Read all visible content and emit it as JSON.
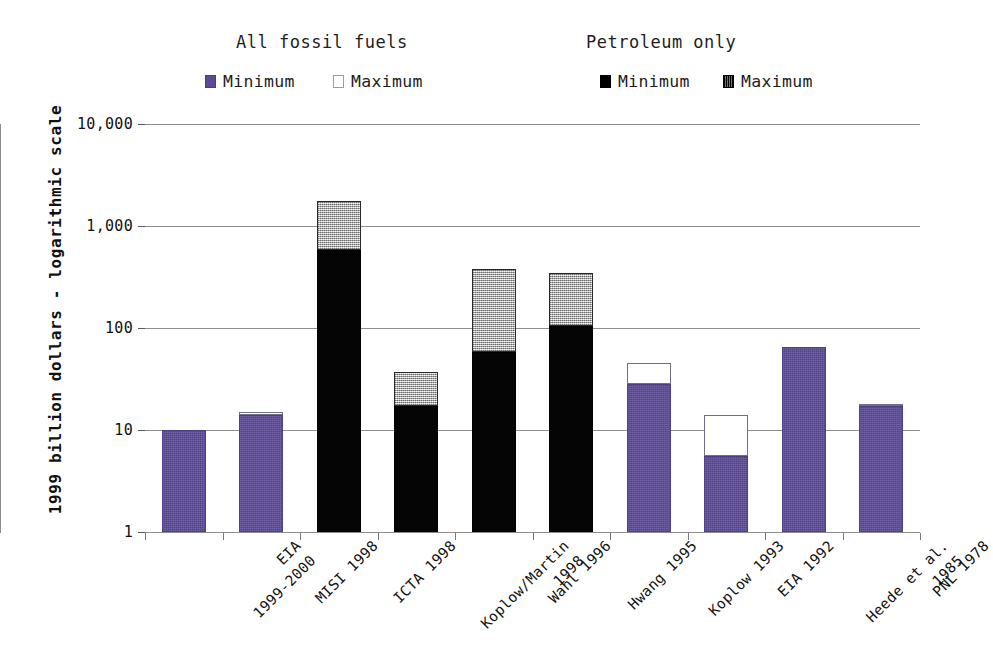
{
  "legend": {
    "groups": [
      {
        "title": "All fossil fuels",
        "entries": [
          {
            "label": "Minimum",
            "swatch": "purple-square-icon"
          },
          {
            "label": "Maximum",
            "swatch": "white-outline-square-icon"
          }
        ]
      },
      {
        "title": "Petroleum only",
        "entries": [
          {
            "label": "Minimum",
            "swatch": "black-square-icon"
          },
          {
            "label": "Maximum",
            "swatch": "hatched-square-icon"
          }
        ]
      }
    ]
  },
  "axis": {
    "y_title": "1999 billion dollars - logarithmic scale",
    "y_tick_labels": [
      "10,000",
      "1,000",
      "100",
      "10",
      "1"
    ]
  },
  "colors": {
    "fossil_minimum": "#5c4a96",
    "fossil_maximum": "#ffffff",
    "petroleum_minimum": "#000000",
    "petroleum_maximum": "#d2d2d2",
    "gridline": "#8d8d8d",
    "background": "#ffffff"
  },
  "chart_data": {
    "type": "bar",
    "title": "",
    "subtitle": "",
    "xlabel": "",
    "ylabel": "1999 billion dollars - logarithmic scale",
    "yscale": "log",
    "ylim": [
      1,
      10000
    ],
    "yticks": [
      1,
      10,
      100,
      1000,
      10000
    ],
    "ytick_labels": [
      "1",
      "10",
      "100",
      "1,000",
      "10,000"
    ],
    "grid": "horizontal",
    "legend_position": "top",
    "stacked": true,
    "categories": [
      "EIA\n1999-2000",
      "MISI 1998",
      "ICTA 1998",
      "Koplow/Martin\n1998",
      "Wahl 1996",
      "Hwang 1995",
      "Koplow 1993",
      "EIA 1992",
      "Heede et al.\n1985",
      "PNL 1978"
    ],
    "series": [
      {
        "name": "All fossil fuels - Minimum",
        "group": "All fossil fuels",
        "stat": "Minimum",
        "color": "#5c4a96",
        "values": [
          10,
          14,
          null,
          null,
          null,
          null,
          28,
          5.6,
          65,
          17
        ]
      },
      {
        "name": "All fossil fuels - Maximum",
        "group": "All fossil fuels",
        "stat": "Maximum",
        "color": "#ffffff",
        "values": [
          10,
          15,
          null,
          null,
          null,
          null,
          45,
          14,
          65,
          18
        ]
      },
      {
        "name": "Petroleum only - Minimum",
        "group": "Petroleum only",
        "stat": "Minimum",
        "color": "#000000",
        "values": [
          null,
          null,
          580,
          17,
          58,
          105,
          null,
          null,
          null,
          null
        ]
      },
      {
        "name": "Petroleum only - Maximum",
        "group": "Petroleum only",
        "stat": "Maximum",
        "color": "#d2d2d2",
        "values": [
          null,
          null,
          1750,
          37,
          380,
          345,
          null,
          null,
          null,
          null
        ]
      }
    ]
  }
}
